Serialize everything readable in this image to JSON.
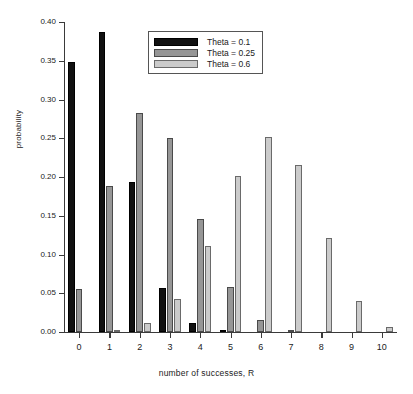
{
  "chart_data": {
    "type": "bar",
    "title": "",
    "xlabel": "number of successes, R",
    "ylabel": "probability",
    "categories": [
      "0",
      "1",
      "2",
      "3",
      "4",
      "5",
      "6",
      "7",
      "8",
      "9",
      "10"
    ],
    "ylim": [
      0.0,
      0.4
    ],
    "ytick_labels": [
      "0.00",
      "0.05",
      "0.10",
      "0.15",
      "0.20",
      "0.25",
      "0.30",
      "0.35",
      "0.40"
    ],
    "ytick_values": [
      0.0,
      0.05,
      0.1,
      0.15,
      0.2,
      0.25,
      0.3,
      0.35,
      0.4
    ],
    "grid": false,
    "legend_position": "top-center",
    "series": [
      {
        "name": "Theta = 0.1",
        "color": "#111111",
        "values": [
          0.349,
          0.387,
          0.194,
          0.057,
          0.011,
          0.001,
          0.0,
          0.0,
          0.0,
          0.0,
          0.0
        ]
      },
      {
        "name": "Theta = 0.25",
        "color": "#969696",
        "values": [
          0.056,
          0.188,
          0.282,
          0.25,
          0.146,
          0.058,
          0.016,
          0.003,
          0.0,
          0.0,
          0.0
        ]
      },
      {
        "name": "Theta = 0.6",
        "color": "#cbcbcb",
        "values": [
          0.0,
          0.002,
          0.011,
          0.042,
          0.111,
          0.201,
          0.251,
          0.215,
          0.121,
          0.04,
          0.006
        ]
      }
    ]
  },
  "legend": {
    "entries": [
      {
        "label": "Theta = 0.1"
      },
      {
        "label": "Theta = 0.25"
      },
      {
        "label": "Theta = 0.6"
      }
    ]
  }
}
